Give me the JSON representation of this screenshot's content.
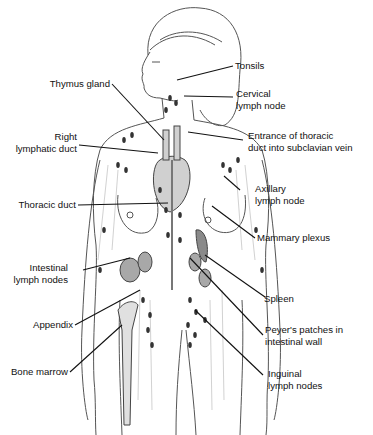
{
  "figure": {
    "labels": {
      "tonsils": "Tonsils",
      "thymus_gland": "Thymus gland",
      "cervical_lymph_node": "Cervical\nlymph node",
      "right_lymphatic_duct": "Right\nlymphatic duct",
      "entrance_thoracic_duct": "Entrance of thoracic\nduct into subclavian vein",
      "axillary_lymph_node": "Axillary\nlymph node",
      "thoracic_duct": "Thoracic duct",
      "mammary_plexus": "Mammary plexus",
      "intestinal_lymph_nodes": "Intestinal\nlymph nodes",
      "spleen": "Spleen",
      "appendix": "Appendix",
      "peyers_patches": "Peyer's patches in\nintestinal wall",
      "bone_marrow": "Bone marrow",
      "inguinal_lymph_nodes": "Inguinal\nlymph nodes"
    },
    "colors": {
      "line": "#111111",
      "organ": "#8a8a8a",
      "node": "#333333",
      "vessel": "#bdbdbd"
    }
  }
}
